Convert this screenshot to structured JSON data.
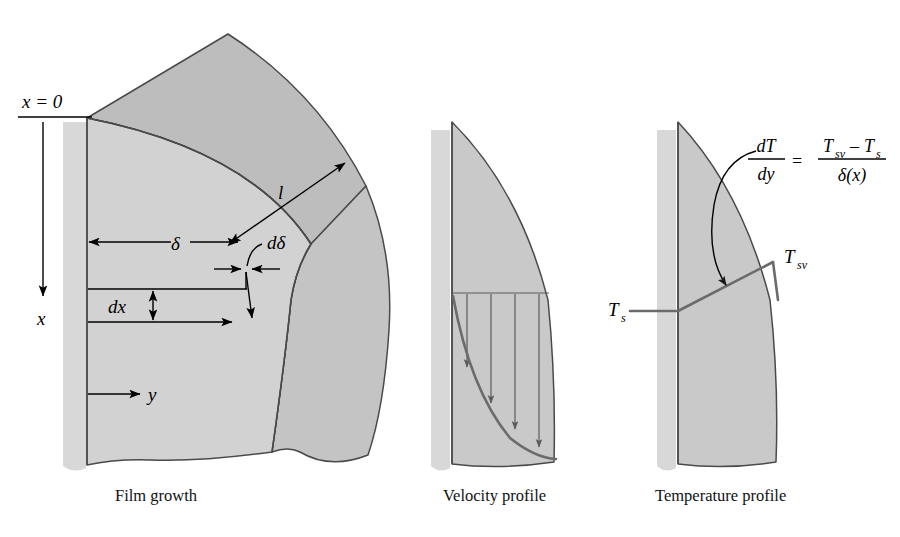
{
  "figure": {
    "background_color": "#ffffff",
    "colors": {
      "film_light": "#d2d2d2",
      "film_mid": "#c4c4c4",
      "top_face_dark": "#bdbdbd",
      "wall_shadow": "#d8d8d8",
      "outline": "#4a4a4a",
      "profile_line": "#6b6b6b",
      "dimension_line": "#000000",
      "text": "#000000"
    }
  },
  "panels": [
    {
      "id": "film-growth",
      "caption": "Film growth",
      "labels": {
        "origin": "x = 0",
        "x_axis": "x",
        "y_axis": "y",
        "delta": "δ",
        "d_delta": "dδ",
        "dx": "dx",
        "length": "l"
      }
    },
    {
      "id": "velocity-profile",
      "caption": "Velocity profile",
      "arrow_count": 4
    },
    {
      "id": "temperature-profile",
      "caption": "Temperature profile",
      "labels": {
        "surface_temp": "T",
        "surface_temp_sub": "s",
        "vapor_temp": "T",
        "vapor_temp_sub": "sv"
      },
      "equation": {
        "lhs_num": "dT",
        "lhs_den": "dy",
        "operator": "=",
        "rhs_num_a": "T",
        "rhs_num_a_sub": "sv",
        "rhs_num_minus": "–",
        "rhs_num_b": "T",
        "rhs_num_b_sub": "s",
        "rhs_den": "δ(x)",
        "plain": "dT/dy = (Tsv – Ts) / δ(x)"
      }
    }
  ]
}
